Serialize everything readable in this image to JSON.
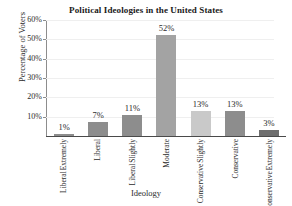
{
  "chart_data": {
    "type": "bar",
    "title": "Political Ideologies in the United States",
    "xlabel": "Ideology",
    "ylabel": "Percentage of Voters",
    "categories": [
      "Extremely Liberal",
      "Liberal",
      "Slightly Liberal",
      "Moderate",
      "Slightly Conservative",
      "Conservative",
      "Extremely Conservative"
    ],
    "category_lines": [
      [
        "Extremely",
        "Liberal"
      ],
      [
        "Liberal"
      ],
      [
        "Slightly",
        "Liberal"
      ],
      [
        "Moderate"
      ],
      [
        "Slightly",
        "Conservative"
      ],
      [
        "Conservative"
      ],
      [
        "Extremely",
        "Conservative"
      ]
    ],
    "values": [
      1,
      7,
      11,
      52,
      13,
      13,
      3
    ],
    "value_labels": [
      "1%",
      "7%",
      "11%",
      "52%",
      "13%",
      "13%",
      "3%"
    ],
    "bar_colors": [
      "#8d8d8d",
      "#8d8d8d",
      "#8d8d8d",
      "#a3a3a3",
      "#c9c9c9",
      "#8d8d8d",
      "#6e6e6e"
    ],
    "ylim": [
      0,
      60
    ],
    "yticks": [
      10,
      20,
      30,
      40,
      50,
      60
    ],
    "ytick_labels": [
      "10%",
      "20%",
      "30%",
      "40%",
      "50%",
      "60%"
    ],
    "grid": true,
    "legend": null
  }
}
